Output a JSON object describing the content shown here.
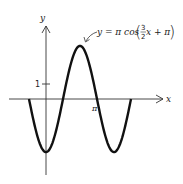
{
  "chart_data": {
    "type": "line",
    "title": "",
    "equation_label": "y = π cos(3/2 x + π)",
    "equation_parts": {
      "lhs": "y = π cos",
      "frac_num": "3",
      "frac_den": "2",
      "rest": "x + π"
    },
    "xlabel": "x",
    "ylabel": "y",
    "x_ticks": [
      {
        "value": 3.14159,
        "label": "π"
      }
    ],
    "y_ticks": [
      {
        "value": 1,
        "label": "1"
      }
    ],
    "xlim": [
      -1.047,
      5.236
    ],
    "ylim": [
      -3.3,
      3.3
    ],
    "grid": false,
    "legend": "none",
    "series": [
      {
        "name": "y = π cos(3/2 x + π)",
        "function": "pi*cos(1.5*x + pi)",
        "domain": [
          -1.047,
          5.236
        ],
        "key_points": [
          {
            "x": -1.047,
            "y": 0
          },
          {
            "x": 0,
            "y": -3.1416
          },
          {
            "x": 1.047,
            "y": 0
          },
          {
            "x": 2.094,
            "y": 3.1416
          },
          {
            "x": 3.1416,
            "y": 0
          },
          {
            "x": 4.189,
            "y": -3.1416
          },
          {
            "x": 5.236,
            "y": 0
          }
        ]
      }
    ]
  },
  "labels": {
    "y_axis": "y",
    "x_axis": "x",
    "y_tick_1": "1",
    "x_tick_pi": "π",
    "eq_lhs": "y = π cos",
    "eq_num": "3",
    "eq_den": "2",
    "eq_rest": "x + π",
    "paren_open": "(",
    "paren_close": ")"
  }
}
